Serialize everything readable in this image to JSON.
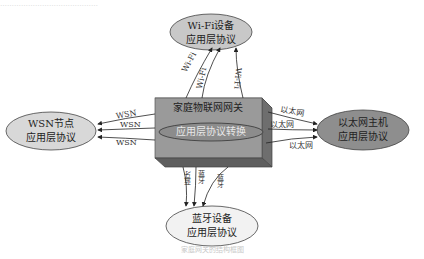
{
  "diagram": {
    "gateway": {
      "title": "家庭物联网网关",
      "inner_label": "应用层协议转换",
      "colors": {
        "front": "#9a9a9a",
        "top": "#bdbdbd",
        "side": "#6e6e6e",
        "inner_ellipse": "#8c8c8c"
      }
    },
    "nodes": {
      "wifi": {
        "line1": "Wi-Fi设备",
        "line2": "应用层协议",
        "fill": "#c8c8c8"
      },
      "wsn": {
        "line1": "WSN节点",
        "line2": "应用层协议",
        "fill": "#d8d8d8"
      },
      "ethernet": {
        "line1": "以太网主机",
        "line2": "应用层协议",
        "fill": "#8e8e8e"
      },
      "bluetooth": {
        "line1": "蓝牙设备",
        "line2": "应用层协议",
        "fill": "#f2f2f2"
      }
    },
    "edges": {
      "wifi": [
        "Wi-Fi",
        "Wi-Fi",
        "Wi-Fi"
      ],
      "wsn": [
        "WSN",
        "WSN",
        "WSN"
      ],
      "ethernet": [
        "以太网",
        "以太网",
        "以太网"
      ],
      "bluetooth": [
        "蓝牙",
        "蓝牙",
        "蓝牙"
      ]
    },
    "caption": "家庭网关的结构框图",
    "top_text": "……………………………………"
  }
}
